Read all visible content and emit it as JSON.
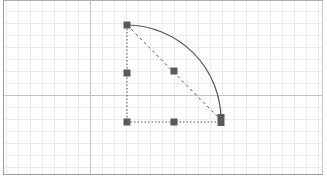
{
  "canvas": {
    "background": "#ffffff",
    "border_color": "#9a9a9a",
    "grid": {
      "minor_spacing": 12,
      "minor_color": "#ececec",
      "major_color": "#c4c4c4",
      "major_x": 90,
      "major_y": 95
    }
  },
  "shape": {
    "type": "quarter-circle-arc",
    "stroke_color": "#555555",
    "guide_color": "#555555",
    "arc": {
      "start": [
        127,
        25
      ],
      "end": [
        221,
        120
      ],
      "radius": 95
    },
    "guides": [
      {
        "from": [
          127,
          25
        ],
        "to": [
          127,
          122
        ],
        "style": "dotted"
      },
      {
        "from": [
          127,
          122
        ],
        "to": [
          221,
          122
        ],
        "style": "dotted"
      },
      {
        "from": [
          127,
          25
        ],
        "to": [
          221,
          120
        ],
        "style": "dashed"
      }
    ]
  },
  "handles": [
    {
      "id": "arc-start",
      "x": 127,
      "y": 25,
      "w": 7,
      "h": 7
    },
    {
      "id": "left-mid",
      "x": 127,
      "y": 73,
      "w": 7,
      "h": 7
    },
    {
      "id": "center",
      "x": 174,
      "y": 71,
      "w": 7,
      "h": 7
    },
    {
      "id": "corner",
      "x": 127,
      "y": 122,
      "w": 7,
      "h": 7
    },
    {
      "id": "bottom-mid",
      "x": 174,
      "y": 122,
      "w": 7,
      "h": 7
    },
    {
      "id": "arc-end",
      "x": 221,
      "y": 120,
      "w": 7,
      "h": 12
    }
  ],
  "handle_color": "#5a5a5a"
}
